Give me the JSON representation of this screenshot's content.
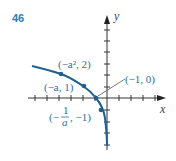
{
  "problem_number": "46",
  "axes": {
    "x_label": "x",
    "y_label": "y"
  },
  "points": [
    {
      "label": "(−a², 2)",
      "note": "point on curve"
    },
    {
      "label": "(−a, 1)",
      "note": "point on curve"
    },
    {
      "label": "(−1, 0)",
      "note": "x-intercept"
    },
    {
      "label": "(−1/a, −1)",
      "note": "point on curve"
    }
  ],
  "fraction": {
    "numerator": "1",
    "denominator": "a",
    "prefix": "(−",
    "suffix": ", −1)"
  },
  "colors": {
    "curve": "#1f5f8f",
    "labels": "#2a6fa8",
    "axes": "#333333",
    "number": "#2e7bb8"
  }
}
